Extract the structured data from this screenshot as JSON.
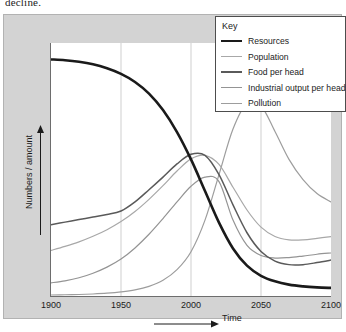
{
  "page": {
    "cropped_body_text": "decline."
  },
  "legend": {
    "title": "Key",
    "entries": [
      {
        "label": "Resources",
        "color": "#1a1a1a",
        "width": 2.6
      },
      {
        "label": "Population",
        "color": "#a8a8a8",
        "width": 1.2
      },
      {
        "label": "Food per head",
        "color": "#5a5a5a",
        "width": 1.5
      },
      {
        "label": "Industrial output per head",
        "color": "#949494",
        "width": 1.2
      },
      {
        "label": "Pollution",
        "color": "#9d9d9d",
        "width": 1.2
      }
    ]
  },
  "axes": {
    "x_title": "Time",
    "y_title": "Numbers / amount",
    "x_ticks": [
      "1900",
      "1950",
      "2000",
      "2050",
      "2100"
    ],
    "gridlines_at": [
      "1950",
      "2000",
      "2050"
    ]
  },
  "colors": {
    "figure_background": "#d3d3d3",
    "plot_background": "#ffffff",
    "axis": "#6d6d6d",
    "gridline": "#cfcfcf",
    "text": "#1b1b1b"
  },
  "chart_data": {
    "type": "line",
    "title": "",
    "xlabel": "Time",
    "ylabel": "Numbers / amount",
    "xlim": [
      1900,
      2100
    ],
    "ylim": [
      0,
      1
    ],
    "grid": true,
    "legend_position": "top-right",
    "x_ticks": [
      1900,
      1950,
      2000,
      2050,
      2100
    ],
    "y_ticks": [],
    "x": [
      1900,
      1910,
      1920,
      1930,
      1940,
      1950,
      1960,
      1970,
      1980,
      1990,
      2000,
      2010,
      2020,
      2030,
      2040,
      2050,
      2060,
      2070,
      2080,
      2090,
      2100
    ],
    "series": [
      {
        "name": "Resources",
        "color": "#1a1a1a",
        "width": 2.6,
        "values": [
          0.935,
          0.932,
          0.926,
          0.916,
          0.9,
          0.878,
          0.846,
          0.8,
          0.735,
          0.648,
          0.54,
          0.415,
          0.29,
          0.188,
          0.12,
          0.08,
          0.058,
          0.045,
          0.038,
          0.034,
          0.032
        ]
      },
      {
        "name": "Population",
        "color": "#a8a8a8",
        "width": 1.2,
        "values": [
          0.18,
          0.196,
          0.214,
          0.236,
          0.262,
          0.294,
          0.334,
          0.382,
          0.436,
          0.494,
          0.542,
          0.556,
          0.52,
          0.43,
          0.34,
          0.272,
          0.235,
          0.222,
          0.222,
          0.228,
          0.235
        ]
      },
      {
        "name": "Food per head",
        "color": "#5a5a5a",
        "width": 1.5,
        "values": [
          0.282,
          0.292,
          0.302,
          0.312,
          0.322,
          0.336,
          0.372,
          0.42,
          0.47,
          0.522,
          0.56,
          0.556,
          0.48,
          0.36,
          0.25,
          0.176,
          0.138,
          0.124,
          0.124,
          0.132,
          0.142
        ]
      },
      {
        "name": "Industrial output per head",
        "color": "#949494",
        "width": 1.2,
        "values": [
          0.052,
          0.06,
          0.072,
          0.09,
          0.114,
          0.146,
          0.19,
          0.244,
          0.306,
          0.372,
          0.434,
          0.47,
          0.452,
          0.3,
          0.2,
          0.16,
          0.15,
          0.152,
          0.158,
          0.165,
          0.17
        ]
      },
      {
        "name": "Pollution",
        "color": "#9d9d9d",
        "width": 1.2,
        "values": [
          0.004,
          0.005,
          0.006,
          0.008,
          0.011,
          0.016,
          0.024,
          0.038,
          0.062,
          0.104,
          0.175,
          0.3,
          0.48,
          0.66,
          0.762,
          0.752,
          0.65,
          0.54,
          0.46,
          0.405,
          0.372
        ]
      }
    ]
  }
}
